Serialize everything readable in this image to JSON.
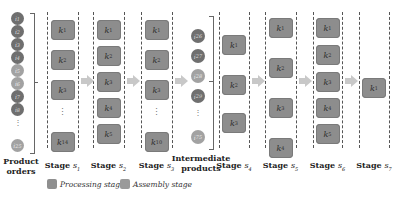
{
  "product_orders": {
    "label_line1": "Product",
    "label_line2": "orders",
    "items": [
      {
        "text": "i1",
        "shade": "dark"
      },
      {
        "text": "i2",
        "shade": "dark"
      },
      {
        "text": "i3",
        "shade": "dark"
      },
      {
        "text": "i4",
        "shade": "dark"
      },
      {
        "text": "i5",
        "shade": "light"
      },
      {
        "text": "i6",
        "shade": "light"
      },
      {
        "text": "i7",
        "shade": "dark"
      },
      {
        "text": "i8",
        "shade": "dark"
      },
      {
        "text": "i25",
        "shade": "light"
      }
    ],
    "ellipsis": "⋮"
  },
  "intermediate_products": {
    "label_line1": "Intermediate",
    "label_line2": "products",
    "items": [
      {
        "text": "i26",
        "shade": "dark"
      },
      {
        "text": "i27",
        "shade": "dark"
      },
      {
        "text": "i28",
        "shade": "light"
      },
      {
        "text": "i29",
        "shade": "dark"
      },
      {
        "text": "i75",
        "shade": "light"
      }
    ],
    "ellipsis": "⋮"
  },
  "stages": [
    {
      "name": "Stage",
      "sub": "s1",
      "machines": [
        "k1",
        "k2",
        "k3",
        "⋮",
        "k14"
      ]
    },
    {
      "name": "Stage",
      "sub": "s2",
      "machines": [
        "k1",
        "k2",
        "k3",
        "k4",
        "k5"
      ]
    },
    {
      "name": "Stage",
      "sub": "s3",
      "machines": [
        "k1",
        "k2",
        "k3",
        "⋮",
        "k10"
      ]
    },
    {
      "name": "Stage",
      "sub": "s4",
      "machines": [
        "k1",
        "k2",
        "k3"
      ]
    },
    {
      "name": "Stage",
      "sub": "s5",
      "machines": [
        "k1",
        "k2",
        "k3",
        "k4"
      ]
    },
    {
      "name": "Stage",
      "sub": "s6",
      "machines": [
        "k1",
        "k2",
        "k3",
        "k4",
        "k5"
      ]
    },
    {
      "name": "Stage",
      "sub": "s7",
      "machines": [
        "k1"
      ]
    }
  ],
  "legend": {
    "processing": "Processing stage",
    "assembly": "Assembly stage"
  },
  "colors": {
    "machine_box": "#8d8d8d",
    "circle_dark": "#6f6f6f",
    "circle_light": "#a2a2a2",
    "arrow": "#c8c8c8"
  }
}
